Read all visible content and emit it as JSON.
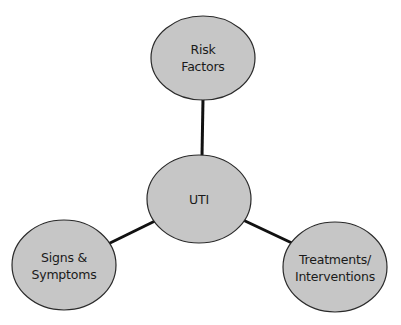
{
  "diagram": {
    "type": "concept-map",
    "colors": {
      "node_fill": "#c6c6c6",
      "node_stroke": "#2a2a2a",
      "edge": "#111111",
      "text": "#1a1a1a",
      "background": "#ffffff"
    },
    "nodes": {
      "center": {
        "label": "UTI",
        "cx": 199,
        "cy": 199,
        "rx": 52,
        "ry": 44
      },
      "top": {
        "label": "Risk\nFactors",
        "cx": 203,
        "cy": 58,
        "rx": 52,
        "ry": 42
      },
      "left": {
        "label": "Signs &\nSymptoms",
        "cx": 64,
        "cy": 265,
        "rx": 52,
        "ry": 45
      },
      "right": {
        "label": "Treatments/\nInterventions",
        "cx": 335,
        "cy": 267,
        "rx": 52,
        "ry": 45
      }
    },
    "edges": [
      {
        "from": "center",
        "to": "top"
      },
      {
        "from": "center",
        "to": "left"
      },
      {
        "from": "center",
        "to": "right"
      }
    ]
  }
}
